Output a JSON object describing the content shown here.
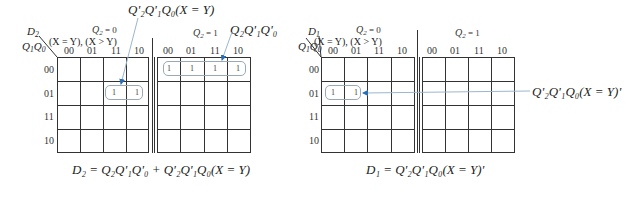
{
  "left_map": {
    "corner_top": "D",
    "corner_top_sub": "2",
    "corner_bottom": "Q",
    "corner_bottom_sub1": "1",
    "corner_bottom_q0": "Q",
    "corner_bottom_sub0": "0",
    "inputs_label": "(X = Y), (X > Y)",
    "section0_label": "Q",
    "section0_sub": "2",
    "section0_value": " = 0",
    "section1_label": "Q",
    "section1_sub": "2",
    "section1_value": " = 1",
    "column_headers": [
      "00",
      "01",
      "11",
      "10"
    ],
    "row_headers": [
      "00",
      "01",
      "11",
      "10"
    ],
    "section0_cells": [
      [
        "",
        "",
        "",
        ""
      ],
      [
        "",
        "",
        "1",
        "1"
      ],
      [
        "",
        "",
        "",
        ""
      ],
      [
        "",
        "",
        "",
        ""
      ]
    ],
    "section1_cells": [
      [
        "1",
        "1",
        "1",
        "1"
      ],
      [
        "",
        "",
        "",
        ""
      ],
      [
        "",
        "",
        "",
        ""
      ],
      [
        "",
        "",
        "",
        ""
      ]
    ],
    "annotation_top": "Q'₂Q'₁Q₀(X = Y)",
    "annotation_right": "Q₂Q'₁Q'₀",
    "equation": "D₂ = Q₂Q'₁Q'₀ + Q'₂Q'₁Q₀(X = Y)"
  },
  "right_map": {
    "corner_top": "D",
    "corner_top_sub": "1",
    "corner_bottom": "Q",
    "corner_bottom_sub1": "1",
    "corner_bottom_q0": "Q",
    "corner_bottom_sub0": "0",
    "inputs_label": "(X = Y), (X > Y)",
    "section0_label": "Q",
    "section0_sub": "2",
    "section0_value": " = 0",
    "section1_label": "Q",
    "section1_sub": "2",
    "section1_value": " = 1",
    "column_headers": [
      "00",
      "01",
      "11",
      "10"
    ],
    "row_headers": [
      "00",
      "01",
      "11",
      "10"
    ],
    "section0_cells": [
      [
        "",
        "",
        "",
        ""
      ],
      [
        "1",
        "1",
        "",
        ""
      ],
      [
        "",
        "",
        "",
        ""
      ],
      [
        "",
        "",
        "",
        ""
      ]
    ],
    "section1_cells": [
      [
        "",
        "",
        "",
        ""
      ],
      [
        "",
        "",
        "",
        ""
      ],
      [
        "",
        "",
        "",
        ""
      ],
      [
        "",
        "",
        "",
        ""
      ]
    ],
    "annotation_right": "Q'₂Q'₁Q₀(X = Y)'",
    "equation": "D₁ = Q'₂Q'₁Q₀(X = Y)'"
  },
  "colors": {
    "grid": "#333333",
    "group_outline": "#9aaab4",
    "arrow": "#2a6db5",
    "leader_line": "#9ab7cc"
  }
}
